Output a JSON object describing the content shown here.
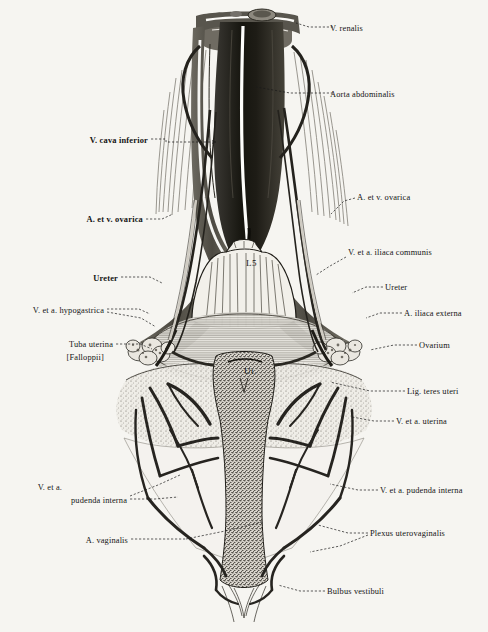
{
  "figure": {
    "background_color": "#f6f5f1",
    "ink_color": "#1a1a1a"
  },
  "inline_labels": [
    {
      "name": "vertebra-l5",
      "text": "L5",
      "x": 246,
      "y": 264
    },
    {
      "name": "uterus",
      "text": "Ut.",
      "x": 244,
      "y": 372
    }
  ],
  "labels": [
    {
      "name": "v-renalis",
      "text": "V. renalis",
      "side": "right",
      "x": 330,
      "y": 29,
      "bold": false
    },
    {
      "name": "aorta-abdominalis",
      "text": "Aorta abdominalis",
      "side": "right",
      "x": 330,
      "y": 95,
      "bold": false
    },
    {
      "name": "v-cava-inferior",
      "text": "V. cava inferior",
      "side": "left",
      "x": 148,
      "y": 141,
      "bold": true
    },
    {
      "name": "a-et-v-ovarica-right",
      "text": "A. et v. ovarica",
      "side": "right",
      "x": 357,
      "y": 198,
      "bold": false
    },
    {
      "name": "a-et-v-ovarica-left",
      "text": "A. et v. ovarica",
      "side": "left",
      "x": 143,
      "y": 220,
      "bold": true
    },
    {
      "name": "v-et-a-iliaca-communis",
      "text": "V. et a. iliaca communis",
      "side": "right",
      "x": 348,
      "y": 253,
      "bold": false
    },
    {
      "name": "ureter-left",
      "text": "Ureter",
      "side": "left",
      "x": 118,
      "y": 279,
      "bold": true
    },
    {
      "name": "ureter-right",
      "text": "Ureter",
      "side": "right",
      "x": 385,
      "y": 288,
      "bold": false
    },
    {
      "name": "v-et-a-hypogastrica",
      "text": "V. et a. hypogastrica",
      "side": "left",
      "x": 104,
      "y": 311,
      "bold": false
    },
    {
      "name": "a-iliaca-externa",
      "text": "A. iliaca externa",
      "side": "right",
      "x": 404,
      "y": 314,
      "bold": false
    },
    {
      "name": "tuba-uterina-1",
      "text": "Tuba uterina",
      "side": "left",
      "x": 113,
      "y": 345,
      "bold": false
    },
    {
      "name": "tuba-uterina-2",
      "text": "[Falloppii]",
      "side": "left",
      "x": 104,
      "y": 358,
      "bold": false
    },
    {
      "name": "ovarium",
      "text": "Ovarium",
      "side": "right",
      "x": 419,
      "y": 346,
      "bold": false
    },
    {
      "name": "lig-teres-uteri",
      "text": "Lig. teres uteri",
      "side": "right",
      "x": 407,
      "y": 392,
      "bold": false
    },
    {
      "name": "v-et-a-uterina",
      "text": "V. et a. uterina",
      "side": "right",
      "x": 396,
      "y": 422,
      "bold": false
    },
    {
      "name": "v-et-a-pudenda-interna-left-1",
      "text": "V. et a.",
      "side": "left",
      "x": 62,
      "y": 488,
      "bold": false
    },
    {
      "name": "v-et-a-pudenda-interna-left-2",
      "text": "pudenda interna",
      "side": "left",
      "x": 127,
      "y": 501,
      "bold": false
    },
    {
      "name": "v-et-a-pudenda-interna-right",
      "text": "V. et a. pudenda interna",
      "side": "right",
      "x": 380,
      "y": 491,
      "bold": false
    },
    {
      "name": "plexus-uterovaginalis",
      "text": "Plexus uterovaginalis",
      "side": "right",
      "x": 370,
      "y": 534,
      "bold": false
    },
    {
      "name": "a-vaginalis",
      "text": "A. vaginalis",
      "side": "left",
      "x": 128,
      "y": 541,
      "bold": false
    },
    {
      "name": "bulbus-vestibuli",
      "text": "Bulbus vestibuli",
      "side": "right",
      "x": 327,
      "y": 592,
      "bold": false
    }
  ],
  "leaders": [
    {
      "name": "leader-v-renalis",
      "d": "M 333 27 L 309 27 L 296 23",
      "arrow": false
    },
    {
      "name": "leader-aorta",
      "d": "M 333 93 L 290 93 L 256 87",
      "arrow": false
    },
    {
      "name": "leader-v-cava",
      "d": "M 151 139 L 166 139 L 166 142 L 216 142",
      "arrow": true
    },
    {
      "name": "leader-ovarica-right",
      "d": "M 355 198 L 344 201 L 331 214",
      "arrow": false
    },
    {
      "name": "leader-ovarica-left",
      "d": "M 146 219 L 162 219 L 173 214",
      "arrow": false
    },
    {
      "name": "leader-iliaca-communis",
      "d": "M 346 257 L 330 266 L 316 275",
      "arrow": false
    },
    {
      "name": "leader-ureter-left",
      "d": "M 121 277 L 150 277 L 162 283",
      "arrow": false
    },
    {
      "name": "leader-ureter-right",
      "d": "M 383 287 L 366 287 L 352 293",
      "arrow": false
    },
    {
      "name": "leader-hypogastrica",
      "d": "M 107 309 L 139 309 L 150 314",
      "arrow": false
    },
    {
      "name": "leader-hypogastrica-2",
      "d": "M 107 312 L 141 318 L 156 327",
      "arrow": false
    },
    {
      "name": "leader-iliaca-externa",
      "d": "M 402 313 L 380 313 L 366 318",
      "arrow": false
    },
    {
      "name": "leader-tuba-uterina",
      "d": "M 116 344 L 140 344 L 152 349",
      "arrow": false
    },
    {
      "name": "leader-ovarium",
      "d": "M 417 345 L 394 345 L 370 350",
      "arrow": false
    },
    {
      "name": "leader-lig-teres",
      "d": "M 405 391 L 370 391 L 330 382",
      "arrow": false
    },
    {
      "name": "leader-uterina",
      "d": "M 394 421 L 374 421 L 352 417",
      "arrow": false
    },
    {
      "name": "leader-pudenda-left",
      "d": "M 130 499 L 155 499 L 178 497",
      "arrow": false
    },
    {
      "name": "leader-pudenda-left-2",
      "d": "M 130 496 L 158 485 L 180 475",
      "arrow": false
    },
    {
      "name": "leader-pudenda-right",
      "d": "M 378 490 L 358 490 L 330 484",
      "arrow": false
    },
    {
      "name": "leader-plexus",
      "d": "M 368 533 L 348 533 L 318 525",
      "arrow": false
    },
    {
      "name": "leader-plexus-2",
      "d": "M 368 535 L 340 546 L 310 552",
      "arrow": false
    },
    {
      "name": "leader-a-vaginalis",
      "d": "M 131 539 L 160 539 L 186 539",
      "arrow": false
    },
    {
      "name": "leader-a-vaginalis-2",
      "d": "M 186 539 L 230 530 L 262 522",
      "arrow": false
    },
    {
      "name": "leader-bulbus",
      "d": "M 325 591 L 300 591 L 278 585",
      "arrow": false
    }
  ]
}
